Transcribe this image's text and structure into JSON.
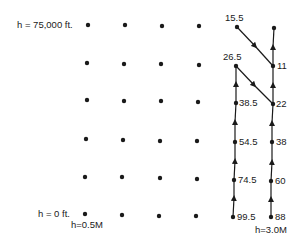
{
  "labels": {
    "top_altitude": "h = 75,000 ft.",
    "bottom_altitude": "h = 0 ft.",
    "left_mass": "h=0.5M",
    "right_mass": "h=3.0M"
  },
  "values": {
    "col5": [
      "15.5",
      "26.5",
      "38.5",
      "54.5",
      "74.5",
      "99.5"
    ],
    "col6": [
      "11",
      "22",
      "38",
      "60",
      "88"
    ]
  },
  "colors": {
    "ink": "#1a1a1a",
    "background": "#ffffff"
  }
}
